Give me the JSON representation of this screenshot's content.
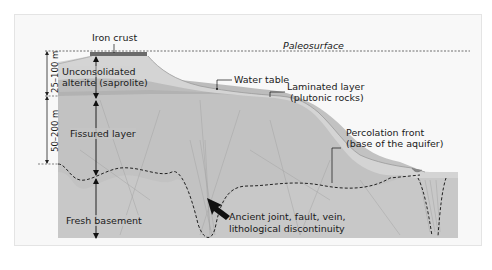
{
  "diagram": {
    "type": "geological cross-section",
    "labels": {
      "iron_crust": "Iron crust",
      "paleosurface": "Paleosurface",
      "unconsolidated_alterite_line1": "Unconsolidated",
      "unconsolidated_alterite_line2": "alterite (saprolite)",
      "water_table": "Water table",
      "laminated_layer_line1": "Laminated layer",
      "laminated_layer_line2": "(plutonic rocks)",
      "fissured_layer": "Fissured layer",
      "percolation_front_line1": "Percolation front",
      "percolation_front_line2": "(base of the aquifer)",
      "fresh_basement": "Fresh basement",
      "discontinuity_line1": "Ancient joint, fault, vein,",
      "discontinuity_line2": "lithological discontinuity"
    },
    "dimensions": {
      "alterite_thickness": "25–100 m",
      "fissured_thickness": "50–200 m"
    },
    "colors": {
      "background": "#ffffff",
      "frame": "#f7f7f7",
      "iron_crust": "#6b6b6b",
      "alterite": "#cfcfcf",
      "saturated_alterite": "#bdbdbd",
      "laminated": "#b4b4b4",
      "fissured": "#c4c4c4",
      "basement": "#c8c8c8",
      "lines": "#1a1a1a",
      "fracture_lines": "#9a9a9a"
    }
  }
}
